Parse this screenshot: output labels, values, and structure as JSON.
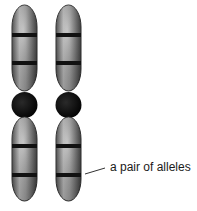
{
  "diagram": {
    "type": "homologous chromosome pair",
    "chromosome_count": 2,
    "bands_per_arm": 2,
    "annotation": {
      "label": "a pair of alleles",
      "points_to": "lower band on lower arm of both chromosomes"
    },
    "colors": {
      "chromatid_light": "#d8d8d8",
      "chromatid_dark": "#3a3a3a",
      "band": "#111111",
      "centromere": "#0c0c0c",
      "outline": "#2a2a2a",
      "pointer": "#333333"
    }
  }
}
